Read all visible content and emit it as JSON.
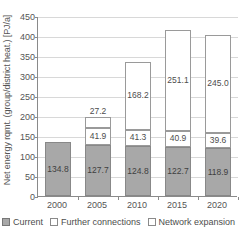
{
  "chart_data": {
    "type": "bar",
    "subtype": "stacked-bar",
    "title": "",
    "xlabel": "",
    "ylabel": "Net energy rqmt. (group/district heat.) [PJ/a]",
    "categories": [
      "2000",
      "2005",
      "2010",
      "2015",
      "2020"
    ],
    "series": [
      {
        "name": "Current",
        "values": [
          134.8,
          127.7,
          124.8,
          122.7,
          118.9
        ],
        "labels": [
          "134.8",
          "127.7",
          "124.8",
          "122.7",
          "118.9"
        ],
        "color": "#a8a8a8"
      },
      {
        "name": "Further connections",
        "values": [
          0,
          41.9,
          41.3,
          40.9,
          39.6
        ],
        "labels": [
          "",
          "41.9",
          "41.3",
          "40.9",
          "39.6"
        ],
        "color": "#ffffff"
      },
      {
        "name": "Network expansion",
        "values": [
          0,
          27.2,
          168.2,
          251.1,
          245.0
        ],
        "labels": [
          "",
          "27.2",
          "168.2",
          "251.1",
          "245.0"
        ],
        "color": "#ffffff"
      }
    ],
    "totals": [
      134.8,
      196.8,
      334.3,
      414.7,
      403.5
    ],
    "ylim": [
      0,
      450
    ],
    "yticks": [
      0,
      50,
      100,
      150,
      200,
      250,
      300,
      350,
      400,
      450
    ],
    "ytick_labels": [
      "0",
      "50",
      "100",
      "150",
      "200",
      "250",
      "300",
      "350",
      "400",
      "450"
    ],
    "grid": true,
    "grid_axis": "y",
    "legend_position": "bottom-left"
  },
  "axes": {
    "y_title": "Net energy rqmt. (group/district heat.) [PJ/a]",
    "y_tick_labels": [
      "450",
      "400",
      "350",
      "300",
      "250",
      "200",
      "150",
      "100",
      "50",
      "0"
    ],
    "x_tick_labels": [
      "2000",
      "2005",
      "2010",
      "2015",
      "2020"
    ]
  },
  "legend": {
    "items": [
      {
        "label": "Current",
        "swatch": "filled"
      },
      {
        "label": "Further connections",
        "swatch": "hollow"
      },
      {
        "label": "Network expansion",
        "swatch": "hollow"
      }
    ]
  }
}
